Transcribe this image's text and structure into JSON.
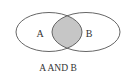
{
  "diagram": {
    "type": "venn",
    "sets": [
      {
        "label": "A"
      },
      {
        "label": "B"
      }
    ],
    "highlighted_region": "intersection",
    "caption": "A AND B",
    "colors": {
      "outline": "#555555",
      "intersection_fill": "#c6c6c6",
      "background": "#ffffff"
    }
  }
}
